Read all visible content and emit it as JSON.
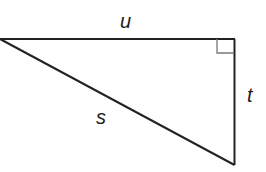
{
  "diagram": {
    "type": "right-triangle",
    "labels": {
      "top_side": "u",
      "right_side": "t",
      "hypotenuse": "s"
    },
    "right_angle_marker": "top-right",
    "colors": {
      "stroke": "#222222",
      "marker": "#777777",
      "background": "#ffffff"
    }
  }
}
